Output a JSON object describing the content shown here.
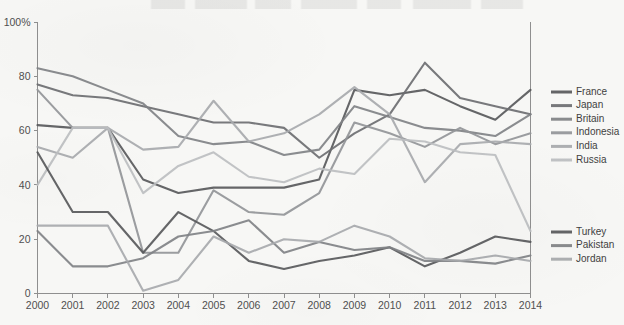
{
  "chart_data": {
    "type": "line",
    "title": "",
    "subtitle": "",
    "xlabel": "",
    "ylabel": "",
    "grid": false,
    "legend_position": "right",
    "x": [
      2000,
      2001,
      2002,
      2003,
      2004,
      2005,
      2006,
      2007,
      2008,
      2009,
      2010,
      2011,
      2012,
      2013,
      2014
    ],
    "categories": [
      "2000",
      "2001",
      "2002",
      "2003",
      "2004",
      "2005",
      "2006",
      "2007",
      "2008",
      "2009",
      "2010",
      "2011",
      "2012",
      "2013",
      "2014"
    ],
    "xlim": [
      2000,
      2014
    ],
    "ylim": [
      0,
      100
    ],
    "ytick_values": [
      0,
      20,
      40,
      60,
      80,
      100
    ],
    "ytick_labels": [
      "0",
      "20",
      "40",
      "60",
      "80",
      "100%"
    ],
    "series": [
      {
        "name": "France",
        "color": "#58595b",
        "values": [
          62,
          61,
          61,
          42,
          37,
          39,
          39,
          39,
          42,
          75,
          73,
          75,
          69,
          64,
          75
        ]
      },
      {
        "name": "Japan",
        "color": "#6d6e71",
        "values": [
          77,
          73,
          72,
          69,
          66,
          63,
          63,
          61,
          50,
          59,
          66,
          85,
          72,
          69,
          66
        ]
      },
      {
        "name": "Britain",
        "color": "#808285",
        "values": [
          83,
          80,
          75,
          70,
          58,
          55,
          56,
          51,
          53,
          69,
          65,
          61,
          60,
          58,
          66
        ]
      },
      {
        "name": "Indonesia",
        "color": "#939598",
        "values": [
          75,
          61,
          61,
          15,
          15,
          38,
          30,
          29,
          37,
          63,
          59,
          54,
          61,
          55,
          59
        ]
      },
      {
        "name": "India",
        "color": "#a7a9ac",
        "values": [
          54,
          50,
          61,
          53,
          54,
          71,
          56,
          59,
          66,
          76,
          66,
          41,
          55,
          56,
          55
        ]
      },
      {
        "name": "Russia",
        "color": "#bcbec0",
        "values": [
          40,
          61,
          61,
          37,
          47,
          52,
          43,
          41,
          46,
          44,
          57,
          56,
          52,
          51,
          23
        ]
      },
      {
        "name": "Turkey",
        "color": "#58595b",
        "values": [
          52,
          30,
          30,
          15,
          30,
          23,
          12,
          9,
          12,
          14,
          17,
          10,
          15,
          21,
          19
        ]
      },
      {
        "name": "Pakistan",
        "color": "#808285",
        "values": [
          23,
          10,
          10,
          13,
          21,
          23,
          27,
          15,
          19,
          16,
          17,
          12,
          12,
          11,
          14
        ]
      },
      {
        "name": "Jordan",
        "color": "#a7a9ac",
        "values": [
          25,
          25,
          25,
          1,
          5,
          21,
          15,
          20,
          19,
          25,
          21,
          13,
          12,
          14,
          12
        ]
      }
    ]
  },
  "legend_groups": [
    {
      "name": "upper-legend-group",
      "items": [
        {
          "label": "France",
          "color": "#58595b"
        },
        {
          "label": "Japan",
          "color": "#6d6e71"
        },
        {
          "label": "Britain",
          "color": "#808285"
        },
        {
          "label": "Indonesia",
          "color": "#939598"
        },
        {
          "label": "India",
          "color": "#a7a9ac"
        },
        {
          "label": "Russia",
          "color": "#bcbec0"
        }
      ]
    },
    {
      "name": "lower-legend-group",
      "items": [
        {
          "label": "Turkey",
          "color": "#58595b"
        },
        {
          "label": "Pakistan",
          "color": "#808285"
        },
        {
          "label": "Jordan",
          "color": "#a7a9ac"
        }
      ]
    }
  ],
  "axes": {
    "y_axis_name": "percent-axis",
    "x_axis_name": "year-axis"
  },
  "colors": {
    "background": "#f7f7f5",
    "axis": "#8f8f8f",
    "text": "#4b4b4b"
  }
}
